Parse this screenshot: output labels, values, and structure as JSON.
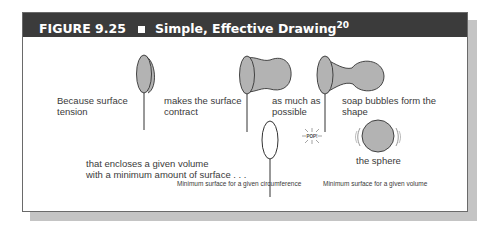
{
  "figure": {
    "number": "FIGURE 9.25",
    "title": "Simple, Effective Drawing",
    "superscript": "20",
    "header_bg": "#3b3b3b",
    "bubble_fill": "#b3b3b3"
  },
  "labels": {
    "step1": [
      "Because surface",
      "tension"
    ],
    "step2": [
      "makes the surface",
      "contract"
    ],
    "step3": [
      "as much as",
      "possible"
    ],
    "step4": [
      "soap bubbles form the",
      "shape"
    ],
    "step5": [
      "that encloses a given volume",
      "with a minimum amount of surface . . ."
    ],
    "step6": "the sphere",
    "pop": "POP!"
  },
  "captions": {
    "left": "Minimum surface for a given circumference",
    "right": "Minimum surface for a given volume"
  }
}
